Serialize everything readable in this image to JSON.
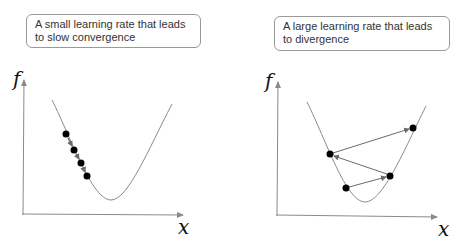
{
  "panels": [
    {
      "caption": "A small learning rate that leads to slow convergence",
      "y_label": "f",
      "x_label": "x",
      "curve": {
        "left_top": [
          52,
          100
        ],
        "minimum": [
          111,
          200
        ],
        "right_top": [
          172,
          104
        ]
      },
      "points": [
        [
          66,
          134
        ],
        [
          74,
          150
        ],
        [
          81,
          163
        ],
        [
          87,
          176
        ]
      ],
      "step_arrows": true
    },
    {
      "caption": "A large learning rate that leads to divergence",
      "y_label": "f",
      "x_label": "x",
      "curve": {
        "left_top": [
          307,
          102
        ],
        "minimum": [
          365,
          202
        ],
        "right_top": [
          426,
          106
        ]
      },
      "points": [
        [
          346,
          188
        ],
        [
          390,
          176
        ],
        [
          330,
          154
        ],
        [
          413,
          128
        ]
      ],
      "step_arrows": true
    }
  ],
  "colors": {
    "curve": "#8a8a8a",
    "axis": "#8a8a8a",
    "point": "#000000",
    "arrow": "#6a6a6a",
    "caption_border": "#9a9a9a"
  }
}
